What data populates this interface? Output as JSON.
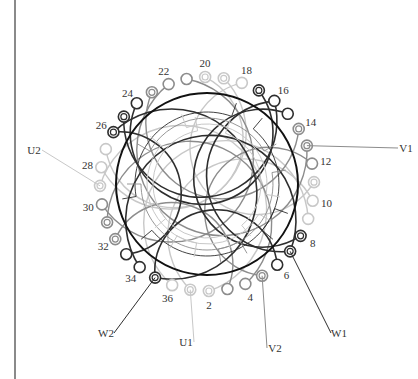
{
  "diagram": {
    "title": "",
    "center": [
      207,
      184
    ],
    "stator_radius": 91,
    "slot_radius": 107,
    "slot_count": 36,
    "colors": {
      "phase_dark": "#2e2e2e",
      "phase_mid": "#8c8c8c",
      "phase_light": "#c8c8c8",
      "stator": "#111111",
      "background": "#ffffff"
    },
    "slot_labels": [
      "2",
      "4",
      "6",
      "8",
      "10",
      "12",
      "14",
      "16",
      "18",
      "20",
      "22",
      "24",
      "26",
      "28",
      "30",
      "32",
      "34",
      "36"
    ],
    "slots": [
      {
        "n": 1,
        "style": "light-double"
      },
      {
        "n": 2,
        "style": "light-double"
      },
      {
        "n": 3,
        "style": "mid-open"
      },
      {
        "n": 4,
        "style": "mid-open"
      },
      {
        "n": 5,
        "style": "mid-double"
      },
      {
        "n": 6,
        "style": "dark-open"
      },
      {
        "n": 7,
        "style": "dark-double"
      },
      {
        "n": 8,
        "style": "dark-double"
      },
      {
        "n": 9,
        "style": "light-open"
      },
      {
        "n": 10,
        "style": "light-open"
      },
      {
        "n": 11,
        "style": "light-double"
      },
      {
        "n": 12,
        "style": "mid-open"
      },
      {
        "n": 13,
        "style": "mid-double"
      },
      {
        "n": 14,
        "style": "mid-double"
      },
      {
        "n": 15,
        "style": "dark-open"
      },
      {
        "n": 16,
        "style": "dark-open"
      },
      {
        "n": 17,
        "style": "dark-double"
      },
      {
        "n": 18,
        "style": "light-open"
      },
      {
        "n": 19,
        "style": "light-double"
      },
      {
        "n": 20,
        "style": "light-double"
      },
      {
        "n": 21,
        "style": "mid-open"
      },
      {
        "n": 22,
        "style": "mid-open"
      },
      {
        "n": 23,
        "style": "mid-double"
      },
      {
        "n": 24,
        "style": "dark-open"
      },
      {
        "n": 25,
        "style": "dark-double"
      },
      {
        "n": 26,
        "style": "dark-double"
      },
      {
        "n": 27,
        "style": "light-open"
      },
      {
        "n": 28,
        "style": "light-open"
      },
      {
        "n": 29,
        "style": "light-double"
      },
      {
        "n": 30,
        "style": "mid-open"
      },
      {
        "n": 31,
        "style": "mid-double"
      },
      {
        "n": 32,
        "style": "mid-double"
      },
      {
        "n": 33,
        "style": "dark-open"
      },
      {
        "n": 34,
        "style": "dark-open"
      },
      {
        "n": 35,
        "style": "dark-double"
      },
      {
        "n": 36,
        "style": "light-open"
      }
    ],
    "terminals": [
      {
        "name": "U1",
        "slot": 1,
        "label_pos": [
          186,
          346
        ]
      },
      {
        "name": "U2",
        "slot": 29,
        "label_pos": [
          34,
          154
        ]
      },
      {
        "name": "V1",
        "slot": 13,
        "label_pos": [
          406,
          152
        ]
      },
      {
        "name": "V2",
        "slot": 5,
        "label_pos": [
          275,
          352
        ]
      },
      {
        "name": "W1",
        "slot": 7,
        "label_pos": [
          339,
          337
        ]
      },
      {
        "name": "W2",
        "slot": 35,
        "label_pos": [
          106,
          337
        ]
      }
    ]
  }
}
